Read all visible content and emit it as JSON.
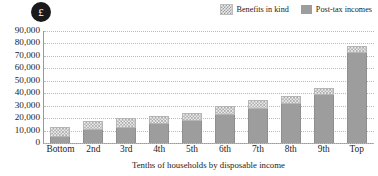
{
  "badge": {
    "symbol": "£",
    "name": "pound-sterling"
  },
  "legend": {
    "position": "top-right",
    "entries": [
      {
        "label": "Benefits in kind",
        "swatch": "hatched",
        "color": "#e8e8e8"
      },
      {
        "label": "Post-tax incomes",
        "swatch": "solid",
        "color": "#9d9d9d"
      }
    ]
  },
  "chart_data": {
    "type": "bar",
    "stacked": true,
    "title": "",
    "subtitle": "",
    "xlabel": "Tenths of households by disposable income",
    "ylabel": "",
    "ylim": [
      0,
      90000
    ],
    "ytick_step": 10000,
    "ytick_labels": [
      "90,000",
      "80,000",
      "70,000",
      "60,000",
      "50,000",
      "40,000",
      "30,000",
      "20,000",
      "10,000",
      "0"
    ],
    "ytick_values": [
      90000,
      80000,
      70000,
      60000,
      50000,
      40000,
      30000,
      20000,
      10000,
      0
    ],
    "grid": true,
    "grid_style": "dotted",
    "categories": [
      "Bottom",
      "2nd",
      "3rd",
      "4th",
      "5th",
      "6th",
      "7th",
      "8th",
      "9th",
      "Top"
    ],
    "series": [
      {
        "name": "Post-tax incomes",
        "color": "#9d9d9d",
        "values": [
          5000,
          10500,
          12000,
          15500,
          18000,
          22500,
          27000,
          31000,
          38500,
          72000
        ]
      },
      {
        "name": "Benefits in kind",
        "color": "#e8e8e8",
        "values": [
          8000,
          7500,
          8000,
          6500,
          6000,
          7000,
          7500,
          6500,
          5500,
          6000
        ]
      }
    ],
    "totals": [
      13000,
      18000,
      20000,
      22000,
      24000,
      29500,
      34500,
      37500,
      44000,
      78000
    ],
    "annotations": [
      "£"
    ]
  }
}
